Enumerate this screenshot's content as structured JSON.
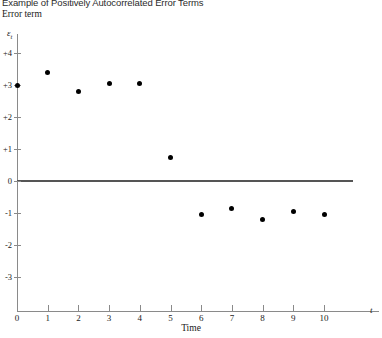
{
  "figure": {
    "title": "Example of Positively Autocorrelated Error Terms",
    "axis_title": "Error term",
    "y_symbol": "ε",
    "y_symbol_sub": "t",
    "x_symbol": "t",
    "x_caption": "Time"
  },
  "chart_data": {
    "type": "scatter",
    "title": "Example of Positively Autocorrelated Error Terms",
    "xlabel": "Time",
    "ylabel": "Error term",
    "y_axis_symbol": "εt",
    "x_axis_symbol": "t",
    "grid": false,
    "legend": null,
    "xlim": [
      0,
      11.8
    ],
    "ylim": [
      -3.5,
      4.4
    ],
    "x": [
      0,
      1,
      2,
      3,
      4,
      5,
      6,
      7,
      8,
      9,
      10
    ],
    "values": [
      3.0,
      3.4,
      2.8,
      3.05,
      3.05,
      0.75,
      -1.05,
      -0.85,
      -1.2,
      -0.95,
      -1.05
    ],
    "zero_reference_line": 0,
    "xticks": [
      0,
      1,
      2,
      3,
      4,
      5,
      6,
      7,
      8,
      9,
      10
    ],
    "xtick_labels": [
      "0",
      "1",
      "2",
      "3",
      "4",
      "5",
      "6",
      "7",
      "8",
      "9",
      "10"
    ],
    "yticks": [
      4,
      3,
      2,
      1,
      0,
      -1,
      -2,
      -3
    ],
    "ytick_labels": [
      "+4",
      "+3",
      "+2",
      "+1",
      "0",
      "-1",
      "-2",
      "-3"
    ],
    "marker": "filled-circle",
    "marker_color": "#000000",
    "axis_color": "#8a8a8a",
    "zero_line_color": "#555555"
  }
}
